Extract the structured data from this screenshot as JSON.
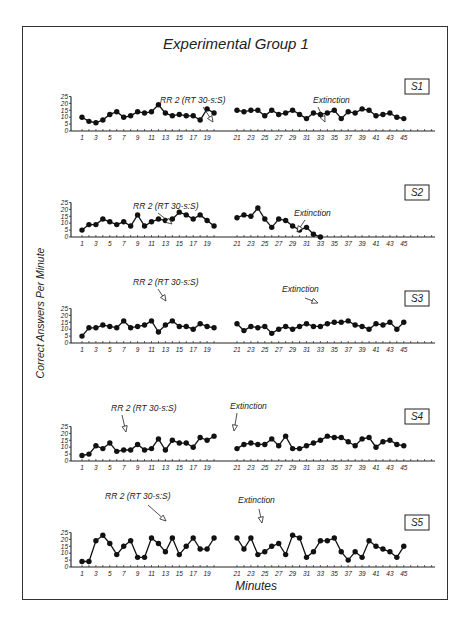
{
  "figure": {
    "title": "Experimental Group 1",
    "ylabel": "Correct Answers Per Minute",
    "xlabel": "Minutes"
  },
  "chart_data": {
    "type": "line",
    "title": "Experimental Group 1",
    "xlabel": "Minutes",
    "ylabel": "Correct Answers Per Minute",
    "ylim": [
      0,
      25
    ],
    "yticks": [
      0,
      5,
      10,
      15,
      20,
      25
    ],
    "xticks": [
      1,
      3,
      5,
      7,
      9,
      11,
      13,
      15,
      17,
      19,
      21,
      23,
      25,
      27,
      29,
      31,
      33,
      35,
      37,
      39,
      41,
      43,
      45
    ],
    "grid": false,
    "phases": [
      "RR 2 (RT 30-s:S)",
      "Extinction"
    ],
    "panels": [
      {
        "subject": "S1",
        "phase1_label": "RR 2 (RT 30-s:S)",
        "phase2_label": "Extinction",
        "phase1": {
          "x": [
            1,
            2,
            3,
            4,
            5,
            6,
            7,
            8,
            9,
            10,
            11,
            12,
            13,
            14,
            15,
            16,
            17,
            18,
            19,
            20
          ],
          "y": [
            10,
            7,
            6,
            8,
            12,
            14,
            10,
            11,
            14,
            13,
            14,
            19,
            13,
            11,
            12,
            11,
            11,
            8,
            16,
            13
          ]
        },
        "phase2": {
          "x": [
            21,
            22,
            23,
            24,
            25,
            26,
            27,
            28,
            29,
            30,
            31,
            32,
            33,
            34,
            35,
            36,
            37,
            38,
            39,
            40,
            41,
            42,
            43,
            44,
            45
          ],
          "y": [
            15,
            14,
            15,
            15,
            11,
            15,
            12,
            13,
            15,
            12,
            9,
            13,
            12,
            13,
            15,
            9,
            14,
            13,
            16,
            15,
            11,
            12,
            13,
            10,
            9
          ]
        }
      },
      {
        "subject": "S2",
        "phase1_label": "RR 2 (RT 30-s:S)",
        "phase2_label": "Extinction",
        "phase1": {
          "x": [
            1,
            2,
            3,
            4,
            5,
            6,
            7,
            8,
            9,
            10,
            11,
            12,
            13,
            14,
            15,
            16,
            17,
            18,
            19,
            20
          ],
          "y": [
            5,
            9,
            9,
            13,
            11,
            9,
            11,
            8,
            16,
            8,
            11,
            13,
            12,
            13,
            18,
            16,
            13,
            16,
            12,
            8
          ]
        },
        "phase2": {
          "x": [
            21,
            22,
            23,
            24,
            25,
            26,
            27,
            28,
            29,
            30,
            31,
            32,
            33
          ],
          "y": [
            14,
            16,
            15,
            21,
            13,
            7,
            13,
            12,
            8,
            5,
            7,
            2,
            0
          ]
        }
      },
      {
        "subject": "S3",
        "phase1_label": "RR 2 (RT 30-s:S)",
        "phase2_label": "Extinction",
        "phase1": {
          "x": [
            1,
            2,
            3,
            4,
            5,
            6,
            7,
            8,
            9,
            10,
            11,
            12,
            13,
            14,
            15,
            16,
            17,
            18,
            19,
            20
          ],
          "y": [
            5,
            11,
            11,
            13,
            12,
            11,
            16,
            11,
            12,
            13,
            16,
            8,
            13,
            16,
            12,
            12,
            10,
            14,
            12,
            11
          ]
        },
        "phase2": {
          "x": [
            21,
            22,
            23,
            24,
            25,
            26,
            27,
            28,
            29,
            30,
            31,
            32,
            33,
            34,
            35,
            36,
            37,
            38,
            39,
            40,
            41,
            42,
            43,
            44,
            45
          ],
          "y": [
            14,
            9,
            12,
            11,
            12,
            7,
            10,
            12,
            10,
            12,
            14,
            12,
            12,
            14,
            15,
            15,
            16,
            13,
            12,
            10,
            14,
            13,
            15,
            10,
            15
          ]
        }
      },
      {
        "subject": "S4",
        "phase1_label": "RR 2 (RT 30-s:S)",
        "phase2_label": "Extinction",
        "phase1": {
          "x": [
            1,
            2,
            3,
            4,
            5,
            6,
            7,
            8,
            9,
            10,
            11,
            12,
            13,
            14,
            15,
            16,
            17,
            18,
            19,
            20
          ],
          "y": [
            4,
            5,
            11,
            9,
            13,
            7,
            8,
            8,
            12,
            8,
            9,
            16,
            8,
            15,
            13,
            13,
            10,
            17,
            15,
            18
          ]
        },
        "phase2": {
          "x": [
            21,
            22,
            23,
            24,
            25,
            26,
            27,
            28,
            29,
            30,
            31,
            32,
            33,
            34,
            35,
            36,
            37,
            38,
            39,
            40,
            41,
            42,
            43,
            44,
            45
          ],
          "y": [
            9,
            12,
            13,
            12,
            12,
            16,
            11,
            18,
            9,
            9,
            11,
            13,
            15,
            18,
            17,
            17,
            14,
            11,
            16,
            17,
            10,
            14,
            15,
            12,
            11
          ]
        }
      },
      {
        "subject": "S5",
        "phase1_label": "RR 2 (RT 30-s:S)",
        "phase2_label": "Extinction",
        "phase1": {
          "x": [
            1,
            2,
            3,
            4,
            5,
            6,
            7,
            8,
            9,
            10,
            11,
            12,
            13,
            14,
            15,
            16,
            17,
            18,
            19,
            20
          ],
          "y": [
            4,
            4,
            19,
            23,
            17,
            9,
            15,
            19,
            7,
            7,
            21,
            17,
            11,
            21,
            9,
            15,
            21,
            13,
            13,
            21
          ]
        },
        "phase2": {
          "x": [
            21,
            22,
            23,
            24,
            25,
            26,
            27,
            28,
            29,
            30,
            31,
            32,
            33,
            34,
            35,
            36,
            37,
            38,
            39,
            40,
            41,
            42,
            43,
            44,
            45
          ],
          "y": [
            21,
            13,
            21,
            9,
            11,
            15,
            17,
            9,
            23,
            21,
            7,
            11,
            19,
            19,
            21,
            11,
            5,
            11,
            7,
            19,
            15,
            13,
            11,
            7,
            15
          ]
        }
      }
    ]
  },
  "layout": {
    "baselines": [
      131,
      237,
      343,
      461,
      567
    ],
    "annotations": [
      {
        "p1_text_x": 160,
        "p1_text_y": 103,
        "p1_arrow": [
          [
            203,
            107
          ],
          [
            213,
            122
          ]
        ],
        "p2_text_x": 313,
        "p2_text_y": 103,
        "p2_arrow": [
          [
            318,
            107
          ],
          [
            325,
            122
          ]
        ]
      },
      {
        "p1_text_x": 133,
        "p1_text_y": 209,
        "p1_arrow": [
          [
            158,
            213
          ],
          [
            172,
            224
          ]
        ],
        "p2_text_x": 294,
        "p2_text_y": 216,
        "p2_arrow": [
          [
            305,
            220
          ],
          [
            297,
            232
          ]
        ]
      },
      {
        "p1_text_x": 133,
        "p1_text_y": 285,
        "p1_arrow": [
          [
            158,
            289
          ],
          [
            166,
            301
          ]
        ],
        "p2_text_x": 282,
        "p2_text_y": 292,
        "p2_arrow": [
          [
            305,
            298
          ],
          [
            318,
            303
          ]
        ]
      },
      {
        "p1_text_x": 111,
        "p1_text_y": 411,
        "p1_arrow": [
          [
            122,
            415
          ],
          [
            126,
            432
          ]
        ],
        "p2_text_x": 230,
        "p2_text_y": 409,
        "p2_arrow": [
          [
            237,
            413
          ],
          [
            234,
            431
          ]
        ]
      },
      {
        "p1_text_x": 105,
        "p1_text_y": 499,
        "p1_arrow": [
          [
            148,
            505
          ],
          [
            166,
            521
          ]
        ],
        "p2_text_x": 238,
        "p2_text_y": 503,
        "p2_arrow": [
          [
            259,
            509
          ],
          [
            262,
            523
          ]
        ]
      }
    ]
  }
}
